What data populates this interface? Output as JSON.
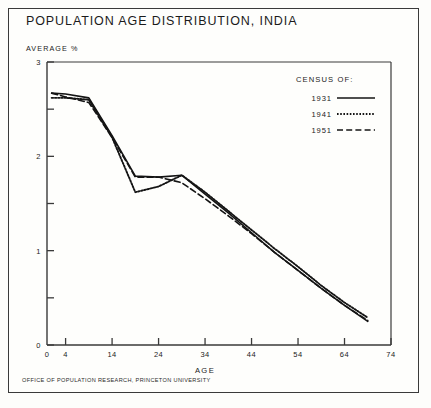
{
  "figure": {
    "title": "POPULATION AGE DISTRIBUTION, INDIA",
    "footer": "OFFICE OF POPULATION RESEARCH, PRINCETON UNIVERSITY",
    "ink_color": "#1b1b1b",
    "frame_color": "#3a3a3a",
    "paper_color": "#fefefc"
  },
  "legend": {
    "heading": "CENSUS OF:",
    "entries": [
      {
        "label": "1931",
        "style": "solid"
      },
      {
        "label": "1941",
        "style": "dotted"
      },
      {
        "label": "1951",
        "style": "dashed"
      }
    ]
  },
  "chart_data": {
    "type": "line",
    "title": "POPULATION AGE DISTRIBUTION, INDIA",
    "xlabel": "AGE",
    "ylabel": "AVERAGE %",
    "xlim": [
      0,
      74
    ],
    "ylim": [
      0,
      3
    ],
    "grid": false,
    "legend_position": "top-right",
    "x_ticks": [
      0,
      4,
      14,
      24,
      34,
      44,
      54,
      64,
      74
    ],
    "x_tick_labels": [
      "0",
      "4",
      "14",
      "24",
      "34",
      "44",
      "54",
      "64",
      "74"
    ],
    "y_ticks": [
      0,
      1,
      2,
      3
    ],
    "y_tick_labels": [
      "0",
      "1",
      "2",
      "3"
    ],
    "y_minor_ticks": [
      0.5,
      1.5,
      2.5
    ],
    "x": [
      1,
      4,
      9,
      14,
      19,
      24,
      29,
      34,
      39,
      44,
      49,
      54,
      59,
      64,
      69
    ],
    "series": [
      {
        "name": "1931",
        "style": "solid",
        "values": [
          2.67,
          2.66,
          2.62,
          2.22,
          1.79,
          1.78,
          1.8,
          1.6,
          1.4,
          1.19,
          0.98,
          0.79,
          0.6,
          0.42,
          0.25
        ]
      },
      {
        "name": "1941",
        "style": "dotted",
        "values": [
          2.62,
          2.62,
          2.6,
          2.2,
          1.62,
          1.68,
          1.8,
          1.62,
          1.42,
          1.22,
          1.02,
          0.83,
          0.63,
          0.45,
          0.29
        ]
      },
      {
        "name": "1951",
        "style": "dashed",
        "values": [
          2.67,
          2.63,
          2.57,
          2.2,
          1.78,
          1.78,
          1.72,
          1.55,
          1.37,
          1.18,
          0.98,
          0.79,
          0.6,
          0.42,
          0.26
        ]
      }
    ]
  }
}
